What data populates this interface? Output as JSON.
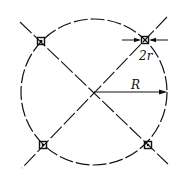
{
  "diagram": {
    "labels": {
      "radius_large": "R",
      "diameter_small": "2r"
    },
    "colors": {
      "stroke": "#111111",
      "background": "#ffffff"
    },
    "circle": {
      "cx": 94,
      "cy": 92,
      "r": 73
    },
    "holes": [
      {
        "name": "upper-left",
        "x": 41,
        "y": 41
      },
      {
        "name": "upper-right",
        "x": 145,
        "y": 40
      },
      {
        "name": "lower-left",
        "x": 43,
        "y": 145
      },
      {
        "name": "lower-right",
        "x": 148,
        "y": 145
      }
    ]
  }
}
